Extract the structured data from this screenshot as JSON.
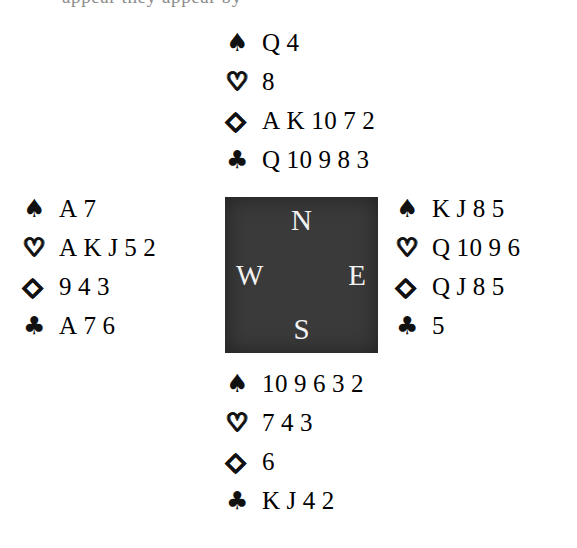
{
  "page": {
    "background_color": "#ffffff",
    "ink_color": "#111111",
    "top_cutoff_sliver_text": "appear they appear by"
  },
  "suits": {
    "spades": {
      "name": "spade-suit-symbol",
      "glyph": "♠",
      "style": "filled"
    },
    "hearts": {
      "name": "heart-suit-symbol",
      "glyph": "♡",
      "style": "outline"
    },
    "diamonds": {
      "name": "diamond-suit-symbol",
      "glyph": "◇",
      "style": "outline"
    },
    "clubs": {
      "name": "club-suit-symbol",
      "glyph": "♣",
      "style": "filled"
    }
  },
  "compass": {
    "box_color": "#3a3a3a",
    "label_color": "#f2f2f2",
    "north": "N",
    "west": "W",
    "east": "E",
    "south": "S"
  },
  "hands": {
    "north": {
      "position": "North",
      "spades": [
        "Q",
        "4"
      ],
      "hearts": [
        "8"
      ],
      "diamonds": [
        "A",
        "K",
        "10",
        "7",
        "2"
      ],
      "clubs": [
        "Q",
        "10",
        "9",
        "8",
        "3"
      ]
    },
    "west": {
      "position": "West",
      "spades": [
        "A",
        "7"
      ],
      "hearts": [
        "A",
        "K",
        "J",
        "5",
        "2"
      ],
      "diamonds": [
        "9",
        "4",
        "3"
      ],
      "clubs": [
        "A",
        "7",
        "6"
      ]
    },
    "east": {
      "position": "East",
      "spades": [
        "K",
        "J",
        "8",
        "5"
      ],
      "hearts": [
        "Q",
        "10",
        "9",
        "6"
      ],
      "diamonds": [
        "Q",
        "J",
        "8",
        "5"
      ],
      "clubs": [
        "5"
      ]
    },
    "south": {
      "position": "South",
      "spades": [
        "10",
        "9",
        "6",
        "3",
        "2"
      ],
      "hearts": [
        "7",
        "4",
        "3"
      ],
      "diamonds": [
        "6"
      ],
      "clubs": [
        "K",
        "J",
        "4",
        "2"
      ]
    }
  }
}
